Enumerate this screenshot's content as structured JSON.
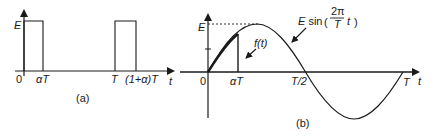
{
  "figure_a": {
    "caption": "(a)",
    "y_label": "E",
    "x_label": "t",
    "tick_labels": [
      "0",
      "αT",
      "T",
      "(1+α)T"
    ],
    "description": "Rectangular pulse train of height E, width αT, period T"
  },
  "figure_b": {
    "caption": "(b)",
    "y_label": "E",
    "x_label": "t",
    "tick_labels": [
      "0",
      "αT",
      "T/2",
      "T"
    ],
    "curve_label_sine": "E sin",
    "curve_label_frac_num": "2π",
    "curve_label_frac_den": "T",
    "curve_label_t": "t",
    "curve_label_f": "f(t)",
    "description": "One period of E sin(2πt/T) with f(t) being the sine truncated at αT"
  },
  "colors": {
    "stroke": "#1a1a1a",
    "background": "#ffffff"
  }
}
